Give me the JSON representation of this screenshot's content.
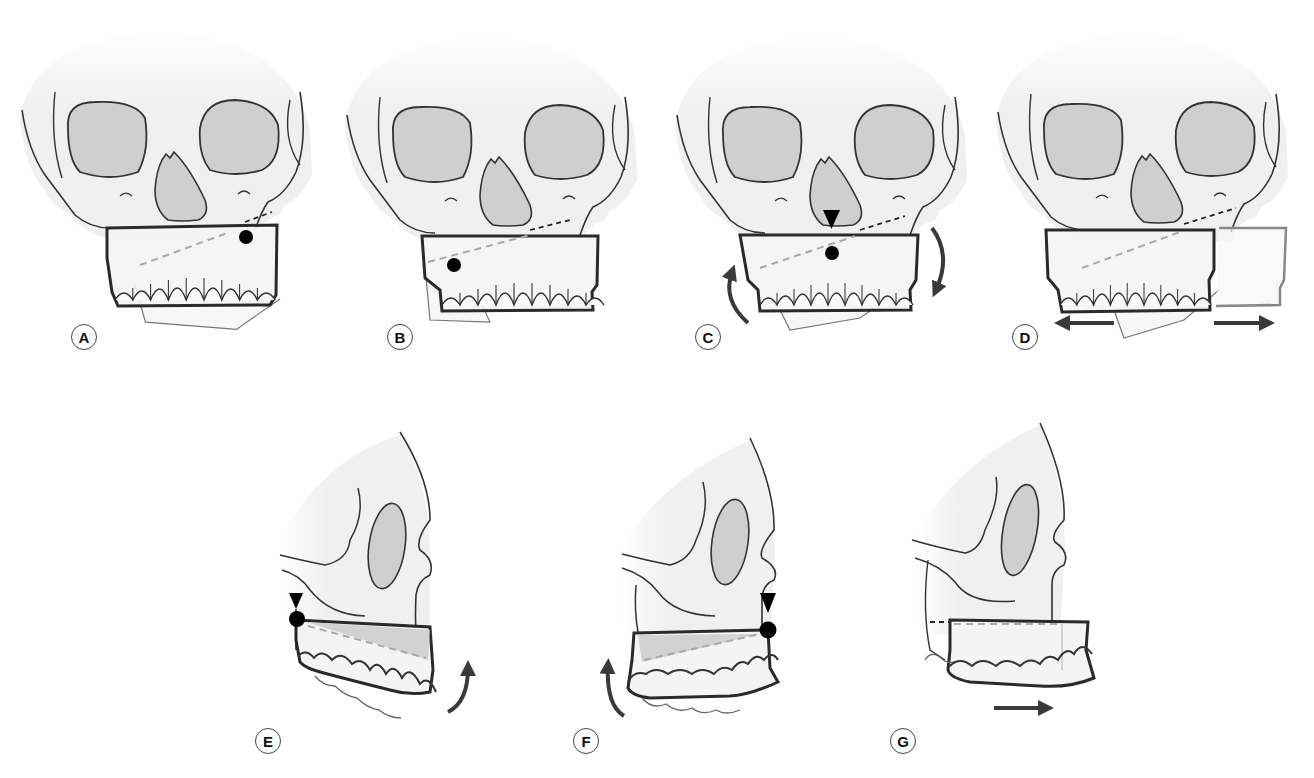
{
  "figure": {
    "colors": {
      "bone_fill": "#f2f2f2",
      "outline": "#333333",
      "cavity_fill": "#cfcfcf",
      "segment_outline": "#2a2a2a",
      "dashed_line": "#a8a8a8",
      "arrow": "#3a3a3a",
      "pivot_dot": "#000000"
    },
    "panels": [
      {
        "id": "A",
        "label": "A",
        "view": "frontal",
        "marker": "pivot-dot-right",
        "arrows": []
      },
      {
        "id": "B",
        "label": "B",
        "view": "frontal",
        "marker": "pivot-dot-left",
        "arrows": []
      },
      {
        "id": "C",
        "label": "C",
        "view": "frontal",
        "marker": "pivot-dot-center-with-arrowhead",
        "arrows": [
          "rotate-counterclockwise-left",
          "rotate-clockwise-right"
        ]
      },
      {
        "id": "D",
        "label": "D",
        "view": "frontal",
        "marker": "none",
        "arrows": [
          "translate-left",
          "translate-right"
        ]
      },
      {
        "id": "E",
        "label": "E",
        "view": "lateral",
        "marker": "pivot-dot-posterior-with-arrowhead",
        "arrows": [
          "rotate-up-anterior"
        ]
      },
      {
        "id": "F",
        "label": "F",
        "view": "lateral",
        "marker": "pivot-dot-anterior-with-arrowhead",
        "arrows": [
          "rotate-up-posterior"
        ]
      },
      {
        "id": "G",
        "label": "G",
        "view": "lateral",
        "marker": "none",
        "arrows": [
          "translate-forward"
        ]
      }
    ]
  }
}
